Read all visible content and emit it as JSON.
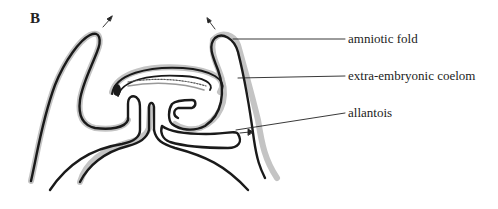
{
  "figure": {
    "panel_letter": "B",
    "labels": [
      {
        "id": "amniotic-fold",
        "text": "amniotic fold"
      },
      {
        "id": "extra-embryonic-coelom",
        "text": "extra-embryonic coelom"
      },
      {
        "id": "allantois",
        "text": "allantois"
      }
    ],
    "colors": {
      "outline": "#1a1a1a",
      "halo": "#b8b8b8",
      "background": "#ffffff"
    }
  }
}
